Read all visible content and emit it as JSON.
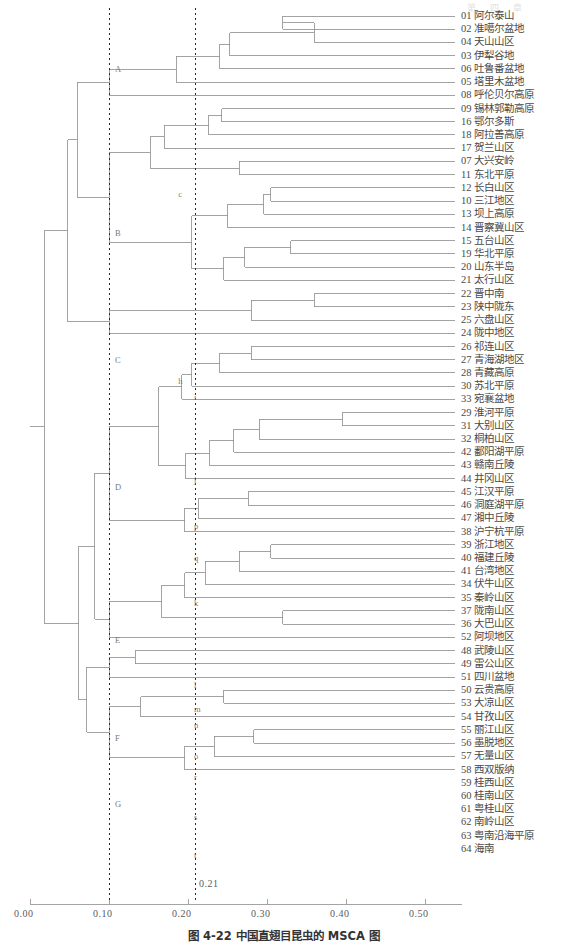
{
  "page_header": "第 四 章",
  "caption": "图 4-22  中国直翅目昆虫的 MSCA 图",
  "axis": {
    "ticks": [
      "0.00",
      "0.10",
      "0.20",
      "0.30",
      "0.40",
      "0.50"
    ],
    "tick_values": [
      0.0,
      0.1,
      0.2,
      0.3,
      0.4,
      0.5
    ],
    "cut_label": "0.21",
    "cut_values": [
      0.1,
      0.21
    ],
    "line_color": "#9a9a9a"
  },
  "tree": {
    "link_color": "#8c8c8c",
    "root_height": 0.58
  },
  "leaves": [
    {
      "code": "01",
      "name": "阿尔泰山"
    },
    {
      "code": "02",
      "name": "准噶尔盆地"
    },
    {
      "code": "04",
      "name": "天山山区"
    },
    {
      "code": "03",
      "name": "伊犁谷地"
    },
    {
      "code": "06",
      "name": "吐鲁番盆地"
    },
    {
      "code": "05",
      "name": "塔里木盆地"
    },
    {
      "code": "08",
      "name": "呼伦贝尔高原"
    },
    {
      "code": "09",
      "name": "锡林郭勒高原"
    },
    {
      "code": "16",
      "name": "鄂尔多斯"
    },
    {
      "code": "18",
      "name": "阿拉善高原"
    },
    {
      "code": "17",
      "name": "贺兰山区"
    },
    {
      "code": "07",
      "name": "大兴安岭"
    },
    {
      "code": "11",
      "name": "东北平原"
    },
    {
      "code": "12",
      "name": "长白山区"
    },
    {
      "code": "10",
      "name": "三江地区"
    },
    {
      "code": "13",
      "name": "坝上高原"
    },
    {
      "code": "14",
      "name": "晋察冀山区"
    },
    {
      "code": "15",
      "name": "五台山区"
    },
    {
      "code": "19",
      "name": "华北平原"
    },
    {
      "code": "20",
      "name": "山东半岛"
    },
    {
      "code": "21",
      "name": "太行山区"
    },
    {
      "code": "22",
      "name": "晋中南"
    },
    {
      "code": "23",
      "name": "陕中陇东"
    },
    {
      "code": "25",
      "name": "六盘山区"
    },
    {
      "code": "24",
      "name": "陇中地区"
    },
    {
      "code": "26",
      "name": "祁连山区"
    },
    {
      "code": "27",
      "name": "青海湖地区"
    },
    {
      "code": "28",
      "name": "青藏高原"
    },
    {
      "code": "30",
      "name": "苏北平原"
    },
    {
      "code": "33",
      "name": "宛襄盆地"
    },
    {
      "code": "29",
      "name": "淮河平原"
    },
    {
      "code": "31",
      "name": "大别山区"
    },
    {
      "code": "32",
      "name": "桐柏山区"
    },
    {
      "code": "42",
      "name": "鄱阳湖平原"
    },
    {
      "code": "43",
      "name": "赣南丘陵"
    },
    {
      "code": "44",
      "name": "井冈山区"
    },
    {
      "code": "45",
      "name": "江汉平原"
    },
    {
      "code": "46",
      "name": "洞庭湖平原"
    },
    {
      "code": "47",
      "name": "湘中丘陵"
    },
    {
      "code": "38",
      "name": "沪宁杭平原"
    },
    {
      "code": "39",
      "name": "浙江地区"
    },
    {
      "code": "40",
      "name": "福建丘陵"
    },
    {
      "code": "41",
      "name": "台湾地区"
    },
    {
      "code": "34",
      "name": "伏牛山区"
    },
    {
      "code": "35",
      "name": "秦岭山区"
    },
    {
      "code": "37",
      "name": "陇南山区"
    },
    {
      "code": "36",
      "name": "大巴山区"
    },
    {
      "code": "52",
      "name": "阿坝地区"
    },
    {
      "code": "48",
      "name": "武陵山区"
    },
    {
      "code": "49",
      "name": "雷公山区"
    },
    {
      "code": "51",
      "name": "四川盆地"
    },
    {
      "code": "50",
      "name": "云贵高原"
    },
    {
      "code": "53",
      "name": "大凉山区"
    },
    {
      "code": "54",
      "name": "甘孜山区"
    },
    {
      "code": "55",
      "name": "丽江山区"
    },
    {
      "code": "56",
      "name": "墨脱地区"
    },
    {
      "code": "57",
      "name": "无量山区"
    },
    {
      "code": "58",
      "name": "西双版纳"
    },
    {
      "code": "59",
      "name": "桂西山区"
    },
    {
      "code": "60",
      "name": "桂南山区"
    },
    {
      "code": "61",
      "name": "粤桂山区"
    },
    {
      "code": "62",
      "name": "南岭山区"
    },
    {
      "code": "63",
      "name": "粤南沿海平原"
    },
    {
      "code": "64",
      "name": "海南"
    }
  ],
  "cluster_labels": [
    {
      "id": "A",
      "x": 0.105,
      "y_leaf": 4.0
    },
    {
      "id": "B",
      "x": 0.105,
      "y_leaf": 16.4
    },
    {
      "id": "C",
      "x": 0.105,
      "y_leaf": 26.0
    },
    {
      "id": "D",
      "x": 0.105,
      "y_leaf": 35.6
    },
    {
      "id": "E",
      "x": 0.105,
      "y_leaf": 47.2
    },
    {
      "id": "F",
      "x": 0.105,
      "y_leaf": 54.6
    },
    {
      "id": "G",
      "x": 0.105,
      "y_leaf": 59.6
    },
    {
      "id": "c",
      "x": 0.185,
      "y_leaf": 13.5
    },
    {
      "id": "h",
      "x": 0.185,
      "y_leaf": 27.6
    },
    {
      "id": "i",
      "x": 0.205,
      "y_leaf": 28.8
    },
    {
      "id": "j",
      "x": 0.205,
      "y_leaf": 35.1
    },
    {
      "id": "p",
      "x": 0.205,
      "y_leaf": 38.6
    },
    {
      "id": "q",
      "x": 0.205,
      "y_leaf": 41.0
    },
    {
      "id": "k",
      "x": 0.205,
      "y_leaf": 44.4
    },
    {
      "id": "l",
      "x": 0.205,
      "y_leaf": 50.6
    },
    {
      "id": "m",
      "x": 0.205,
      "y_leaf": 52.4
    },
    {
      "id": "n",
      "x": 0.205,
      "y_leaf": 53.6
    },
    {
      "id": "o",
      "x": 0.205,
      "y_leaf": 56.0
    },
    {
      "id": "r",
      "x": 0.205,
      "y_leaf": 57.6
    },
    {
      "id": "s",
      "x": 0.205,
      "y_leaf": 60.6
    },
    {
      "id": "t",
      "x": 0.205,
      "y_leaf": 63.5
    }
  ],
  "chart_data": {
    "type": "dendrogram",
    "title": "图 4-22  中国直翅目昆虫的 MSCA 图",
    "xlabel": "",
    "ylabel": "",
    "xlim": [
      0.0,
      0.58
    ],
    "n_leaves": 64,
    "links": [
      {
        "id": "n01",
        "children": [
          "L0",
          "L1"
        ],
        "height": 0.32
      },
      {
        "id": "n02",
        "children": [
          "n01",
          "L2"
        ],
        "height": 0.36
      },
      {
        "id": "n03",
        "children": [
          "n02",
          "L3"
        ],
        "height": 0.253
      },
      {
        "id": "n04",
        "children": [
          "n03",
          "L4"
        ],
        "height": 0.24
      },
      {
        "id": "n05",
        "children": [
          "n04",
          "L5"
        ],
        "height": 0.185
      },
      {
        "id": "A",
        "children": [
          "n05",
          "L6"
        ],
        "height": 0.1
      },
      {
        "id": "n07",
        "children": [
          "L7",
          "L8"
        ],
        "height": 0.243
      },
      {
        "id": "n08",
        "children": [
          "n07",
          "L9"
        ],
        "height": 0.226
      },
      {
        "id": "n09",
        "children": [
          "n08",
          "L10"
        ],
        "height": 0.17
      },
      {
        "id": "n10",
        "children": [
          "L11",
          "L12"
        ],
        "height": 0.265
      },
      {
        "id": "c",
        "children": [
          "n09",
          "n10"
        ],
        "height": 0.152
      },
      {
        "id": "n12",
        "children": [
          "L13",
          "L14"
        ],
        "height": 0.305
      },
      {
        "id": "n13",
        "children": [
          "n12",
          "L15"
        ],
        "height": 0.296
      },
      {
        "id": "n14",
        "children": [
          "n13",
          "L16"
        ],
        "height": 0.25
      },
      {
        "id": "n15",
        "children": [
          "L17",
          "L18"
        ],
        "height": 0.33
      },
      {
        "id": "n16",
        "children": [
          "n15",
          "L19"
        ],
        "height": 0.272
      },
      {
        "id": "n17",
        "children": [
          "n16",
          "L20"
        ],
        "height": 0.245
      },
      {
        "id": "n18",
        "children": [
          "n14",
          "n17"
        ],
        "height": 0.205
      },
      {
        "id": "B",
        "children": [
          "c",
          "n18"
        ],
        "height": 0.1
      },
      {
        "id": "n20",
        "children": [
          "L21",
          "L22"
        ],
        "height": 0.36
      },
      {
        "id": "n21",
        "children": [
          "n20",
          "L23"
        ],
        "height": 0.28
      },
      {
        "id": "C",
        "children": [
          "n21",
          "L24"
        ],
        "height": 0.1
      },
      {
        "id": "AB",
        "children": [
          "A",
          "B"
        ],
        "height": 0.06
      },
      {
        "id": "ABC",
        "children": [
          "AB",
          "C"
        ],
        "height": 0.048
      },
      {
        "id": "n25",
        "children": [
          "L25",
          "L26"
        ],
        "height": 0.28
      },
      {
        "id": "n26",
        "children": [
          "n25",
          "L27"
        ],
        "height": 0.24
      },
      {
        "id": "n27",
        "children": [
          "n26",
          "L28"
        ],
        "height": 0.205
      },
      {
        "id": "i",
        "children": [
          "n27",
          "L29"
        ],
        "height": 0.192
      },
      {
        "id": "n29",
        "children": [
          "L30",
          "L31"
        ],
        "height": 0.395
      },
      {
        "id": "n30",
        "children": [
          "n29",
          "L32"
        ],
        "height": 0.29
      },
      {
        "id": "n31",
        "children": [
          "n30",
          "L33"
        ],
        "height": 0.258
      },
      {
        "id": "n32",
        "children": [
          "n31",
          "L34"
        ],
        "height": 0.227
      },
      {
        "id": "j",
        "children": [
          "n32",
          "L35"
        ],
        "height": 0.197
      },
      {
        "id": "h",
        "children": [
          "i",
          "j"
        ],
        "height": 0.163
      },
      {
        "id": "n35",
        "children": [
          "L36",
          "L37"
        ],
        "height": 0.276
      },
      {
        "id": "p",
        "children": [
          "n35",
          "L38"
        ],
        "height": 0.213
      },
      {
        "id": "q",
        "children": [
          "p",
          "L39"
        ],
        "height": 0.196
      },
      {
        "id": "D",
        "children": [
          "h",
          "q"
        ],
        "height": 0.1
      },
      {
        "id": "n39",
        "children": [
          "L40",
          "L41"
        ],
        "height": 0.305
      },
      {
        "id": "n40",
        "children": [
          "n39",
          "L42"
        ],
        "height": 0.265
      },
      {
        "id": "k",
        "children": [
          "n40",
          "L43"
        ],
        "height": 0.222
      },
      {
        "id": "n42",
        "children": [
          "k",
          "L44"
        ],
        "height": 0.196
      },
      {
        "id": "n43",
        "children": [
          "L45",
          "L46"
        ],
        "height": 0.32
      },
      {
        "id": "l",
        "children": [
          "n42",
          "n43"
        ],
        "height": 0.167
      },
      {
        "id": "E",
        "children": [
          "l",
          "L47"
        ],
        "height": 0.1
      },
      {
        "id": "DE",
        "children": [
          "D",
          "E"
        ],
        "height": 0.082
      },
      {
        "id": "m",
        "children": [
          "L48",
          "L49"
        ],
        "height": 0.133
      },
      {
        "id": "F",
        "children": [
          "m",
          "L50"
        ],
        "height": 0.1
      },
      {
        "id": "n48",
        "children": [
          "L51",
          "L52"
        ],
        "height": 0.245
      },
      {
        "id": "r",
        "children": [
          "n48",
          "L53"
        ],
        "height": 0.14
      },
      {
        "id": "n50",
        "children": [
          "L54",
          "L55"
        ],
        "height": 0.283
      },
      {
        "id": "s",
        "children": [
          "n50",
          "L56"
        ],
        "height": 0.233
      },
      {
        "id": "t",
        "children": [
          "s",
          "L57"
        ],
        "height": 0.196
      },
      {
        "id": "G",
        "children": [
          "r",
          "t"
        ],
        "height": 0.1
      },
      {
        "id": "FG",
        "children": [
          "F",
          "G"
        ],
        "height": 0.072
      },
      {
        "id": "DEFG",
        "children": [
          "DE",
          "FG"
        ],
        "height": 0.062
      },
      {
        "id": "root",
        "children": [
          "ABC",
          "DEFG"
        ],
        "height": 0.018
      }
    ]
  }
}
